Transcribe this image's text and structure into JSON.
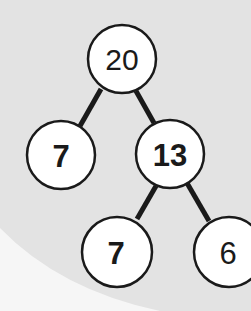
{
  "diagram": {
    "type": "number-bond-tree",
    "colors": {
      "background": "#e3e3e3",
      "page_corner": "#f7f7f7",
      "node_fill": "#ffffff",
      "stroke": "#1a1a1a"
    },
    "nodes": [
      {
        "id": "root",
        "label": "20",
        "bold": false
      },
      {
        "id": "left",
        "label": "7",
        "bold": true
      },
      {
        "id": "right",
        "label": "13",
        "bold": true
      },
      {
        "id": "right-left",
        "label": "7",
        "bold": true
      },
      {
        "id": "right-right",
        "label": "6",
        "bold": false
      }
    ],
    "edges": [
      {
        "from": "20",
        "to": "7"
      },
      {
        "from": "20",
        "to": "13"
      },
      {
        "from": "13",
        "to": "7"
      },
      {
        "from": "13",
        "to": "6"
      }
    ]
  }
}
